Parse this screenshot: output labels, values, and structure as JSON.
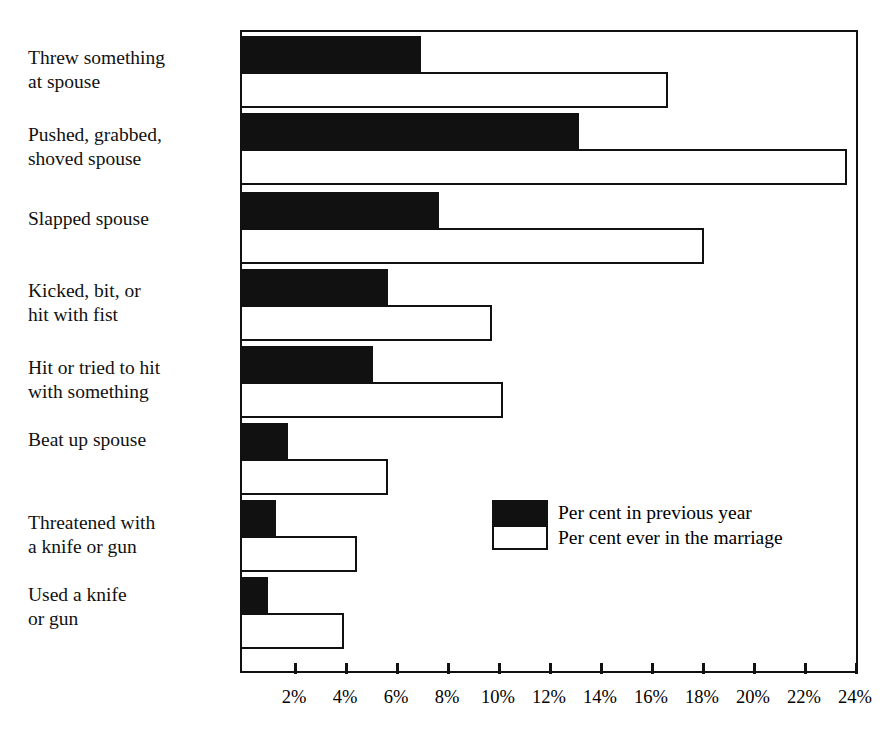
{
  "chart_data": {
    "type": "bar",
    "orientation": "horizontal",
    "title": "",
    "xlabel": "",
    "ylabel": "",
    "xlim": [
      0,
      24.2
    ],
    "grid": false,
    "legend_position": "inside-center-right",
    "categories": [
      "Threw something\nat spouse",
      "Pushed, grabbed,\nshoved spouse",
      "Slapped spouse",
      "Kicked, bit, or\nhit with fist",
      "Hit or tried to hit\nwith something",
      "Beat up spouse",
      "Threatened with\na knife or gun",
      "Used a knife\nor gun"
    ],
    "series": [
      {
        "name": "Per cent in previous year",
        "style": "filled-black",
        "values": [
          6.9,
          13.1,
          7.6,
          5.6,
          5.0,
          1.7,
          1.2,
          0.9
        ]
      },
      {
        "name": "Per cent ever in the marriage",
        "style": "outline-white",
        "values": [
          16.6,
          23.6,
          18.0,
          9.7,
          10.1,
          5.6,
          4.4,
          3.9
        ]
      }
    ],
    "xticks": [
      2,
      4,
      6,
      8,
      10,
      12,
      14,
      16,
      18,
      20,
      22,
      24
    ],
    "xtick_labels": [
      "2%",
      "4%",
      "6%",
      "8%",
      "10%",
      "12%",
      "14%",
      "16%",
      "18%",
      "20%",
      "22%",
      "24%"
    ]
  },
  "legend": {
    "entries": [
      {
        "label": "Per cent in previous year",
        "swatch": "filled-black"
      },
      {
        "label": "Per cent ever in the marriage",
        "swatch": "outline-white"
      }
    ]
  },
  "colors": {
    "ink": "#111111",
    "paper": "#ffffff"
  }
}
